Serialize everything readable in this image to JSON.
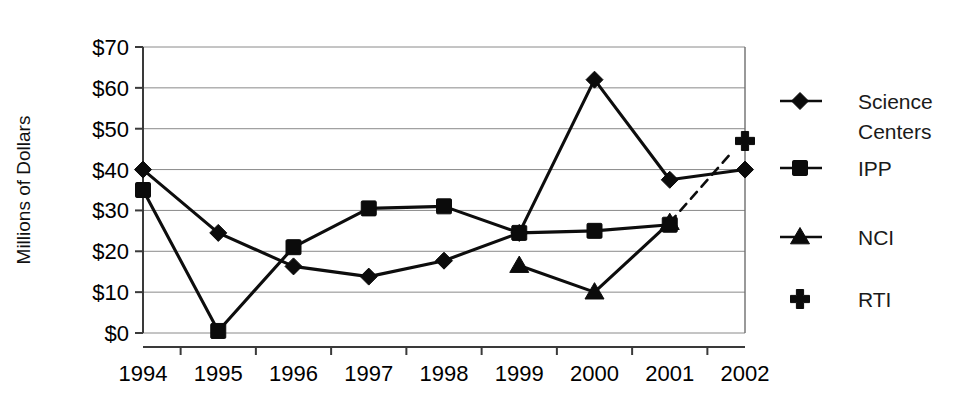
{
  "chart_data": {
    "type": "line",
    "title": "",
    "xlabel": "",
    "ylabel": "Millions of Dollars",
    "x": [
      "1994",
      "1995",
      "1996",
      "1997",
      "1998",
      "1999",
      "2000",
      "2001",
      "2002"
    ],
    "ylim": [
      0,
      70
    ],
    "ytick_values": [
      0,
      10,
      20,
      30,
      40,
      50,
      60,
      70
    ],
    "ytick_labels": [
      "$0",
      "$10",
      "$20",
      "$30",
      "$40",
      "$50",
      "$60",
      "$70"
    ],
    "grid": "horizontal",
    "legend_position": "right",
    "series": [
      {
        "name": "Science Centers",
        "marker": "diamond",
        "line": "solid",
        "values": [
          40.0,
          24.5,
          16.3,
          13.8,
          17.7,
          24.5,
          62.0,
          37.5,
          40.0
        ]
      },
      {
        "name": "IPP",
        "marker": "square",
        "line": "solid",
        "values": [
          35.0,
          0.5,
          21.0,
          30.5,
          31.0,
          24.5,
          25.0,
          26.5,
          null
        ]
      },
      {
        "name": "NCI",
        "marker": "triangle",
        "line": "solid",
        "values": [
          null,
          null,
          null,
          null,
          null,
          16.5,
          10.0,
          27.0,
          null
        ]
      },
      {
        "name": "RTI",
        "marker": "cross",
        "line": "dashed-connector",
        "values": [
          null,
          null,
          null,
          null,
          null,
          null,
          null,
          null,
          47.0
        ]
      }
    ],
    "annotations": [
      {
        "type": "dashed-connector",
        "from_x": "2001",
        "from_y": 27.0,
        "to_x": "2002",
        "to_y": 47.0
      }
    ]
  },
  "legend": {
    "entries": [
      {
        "label": "Science Centers",
        "marker": "diamond",
        "has_line": true
      },
      {
        "label": "IPP",
        "marker": "square",
        "has_line": true
      },
      {
        "label": "NCI",
        "marker": "triangle",
        "has_line": true
      },
      {
        "label": "RTI",
        "marker": "cross",
        "has_line": false
      }
    ]
  },
  "colors": {
    "ink": "#0b0b0b",
    "grid": "#8a8a8a",
    "axis": "#3a3a3a",
    "background": "#ffffff"
  }
}
